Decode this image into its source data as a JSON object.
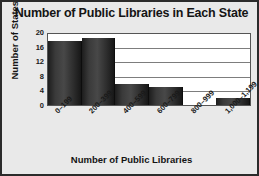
{
  "chart_data": {
    "type": "bar",
    "title": "Number of Public Libraries in Each State",
    "xlabel": "Number of Public Libraries",
    "ylabel": "Number of States",
    "categories": [
      "0–199",
      "200–399",
      "400–599",
      "600–799",
      "800–999",
      "1,000–1,199"
    ],
    "values": [
      18,
      19,
      6,
      5,
      0,
      2
    ],
    "ylim": [
      0,
      20
    ],
    "yticks": [
      20,
      16,
      12,
      8,
      4,
      0
    ],
    "grid": true,
    "legend": false,
    "bar_color": "#3a3a3a",
    "plot_background": "#ffffff",
    "figure_background": "#e9e9e9",
    "frame_color": "#2b2b2b"
  }
}
